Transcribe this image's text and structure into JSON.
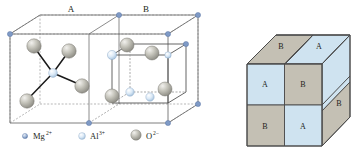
{
  "figure": {
    "background": "#ffffff",
    "left_panel": {
      "name": "spinel-unit-cell-octants",
      "octant_labels": [
        {
          "id": "A",
          "text": "A"
        },
        {
          "id": "B",
          "text": "B"
        }
      ],
      "description_ions": [
        {
          "species": "Mg",
          "charge": "2+",
          "color": "#8fa6c8",
          "role": "corner-tetrahedral-cation"
        },
        {
          "species": "Al",
          "charge": "3+",
          "color": "#cfe0f2",
          "role": "octahedral-cation"
        },
        {
          "species": "O",
          "charge": "2-",
          "color": "#b8b7ae",
          "role": "anion"
        }
      ]
    },
    "legend": {
      "name": "ion-legend",
      "items": [
        {
          "symbol": "Mg",
          "superscript": "2+",
          "color": "#8fa6c8",
          "radius": 2.6
        },
        {
          "symbol": "Al",
          "superscript": "3+",
          "color": "#d2e4f5",
          "radius": 3.2
        },
        {
          "symbol": "O",
          "superscript": "2−",
          "color": "#bdbcb3",
          "radius": 5.2
        }
      ]
    },
    "right_panel": {
      "name": "octant-alternation-cube",
      "front_face": [
        {
          "pos": "top-left",
          "label": "A",
          "fill": "#cfe3f0"
        },
        {
          "pos": "top-right",
          "label": "B",
          "fill": "#c4c0b4"
        },
        {
          "pos": "bottom-left",
          "label": "B",
          "fill": "#c4c0b4"
        },
        {
          "pos": "bottom-right",
          "label": "A",
          "fill": "#cfe3f0"
        }
      ],
      "top_face": [
        {
          "pos": "left",
          "label": "B",
          "fill": "#c4c0b4"
        },
        {
          "pos": "right",
          "label": "A",
          "fill": "#cfe3f0"
        }
      ],
      "right_face": [
        {
          "pos": "upper",
          "label": "",
          "fill": "#cfe3f0"
        },
        {
          "pos": "lower",
          "label": "B",
          "fill": "#c4c0b4"
        }
      ],
      "colors": {
        "blue_octant": "#cfe3f0",
        "tan_octant": "#c4c0b4",
        "edge": "#5a5a5a"
      }
    }
  }
}
